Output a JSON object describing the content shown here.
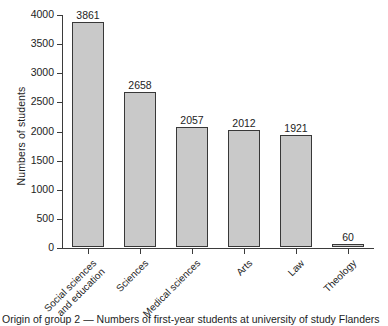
{
  "chart_data": {
    "type": "bar",
    "title": "",
    "xlabel": "",
    "ylabel": "Numbers of students",
    "categories": [
      "Social sciences\nand education",
      "Sciences",
      "Medical sciences",
      "Arts",
      "Law",
      "Theology"
    ],
    "values": [
      3861,
      2658,
      2057,
      2012,
      1921,
      60
    ],
    "value_labels": [
      "3861",
      "2658",
      "2057",
      "2012",
      "1921",
      "60"
    ],
    "ylim": [
      0,
      4000
    ],
    "yticks": [
      0,
      500,
      1000,
      1500,
      2000,
      2500,
      3000,
      3500,
      4000
    ],
    "ytick_labels": [
      "0",
      "500",
      "1000",
      "1500",
      "2000",
      "2500",
      "3000",
      "3500",
      "4000"
    ],
    "grid": false,
    "legend": false,
    "legend_position": "none",
    "bar_fill": "#c9c9c9",
    "bar_edge": "#383838",
    "axis_color": "#3b3b3b"
  },
  "caption": {
    "text": "Origin of group 2 — Numbers of first-year students at university of study Flanders"
  }
}
